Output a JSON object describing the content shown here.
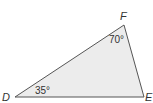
{
  "diagram": {
    "type": "triangle",
    "fill_color": "#ececec",
    "stroke_color": "#555555",
    "vertices": {
      "D": {
        "label": "D",
        "x": 15,
        "y": 97
      },
      "E": {
        "label": "E",
        "x": 144,
        "y": 97
      },
      "F": {
        "label": "F",
        "x": 124,
        "y": 25
      }
    },
    "angles": {
      "D": {
        "label": "35°"
      },
      "F": {
        "label": "70°"
      }
    }
  }
}
